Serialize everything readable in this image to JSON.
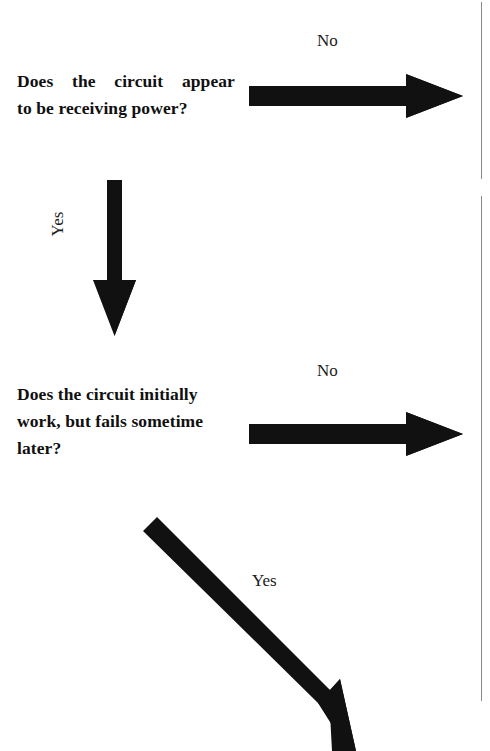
{
  "document": {
    "kind": "troubleshooting-flowchart-fragment",
    "background_color": "#ffffff",
    "ink_color": "#111111"
  },
  "nodes": [
    {
      "id": "question-1",
      "lines": [
        "Does the circuit appear",
        "to be receiving power?"
      ],
      "full_text": "Does the circuit appear to be receiving power?"
    },
    {
      "id": "question-2",
      "lines": [
        "Does the circuit initially",
        "work, but fails sometime",
        "later?"
      ],
      "full_text": "Does the circuit initially work, but fails sometime later?"
    }
  ],
  "edges": [
    {
      "id": "edge-q1-no",
      "label": "No",
      "direction": "right",
      "from": "question-1"
    },
    {
      "id": "edge-q1-yes",
      "label": "Yes",
      "direction": "down",
      "label_rotation_deg": -90,
      "from": "question-1",
      "to": "question-2"
    },
    {
      "id": "edge-q2-no",
      "label": "No",
      "direction": "right",
      "from": "question-2"
    },
    {
      "id": "edge-q2-yes",
      "label": "Yes",
      "direction": "down-right-diagonal",
      "from": "question-2"
    }
  ],
  "rules": [
    {
      "id": "vertical-rule-top",
      "orientation": "vertical",
      "color": "#8a8a8a"
    },
    {
      "id": "vertical-rule-bottom",
      "orientation": "vertical",
      "color": "#8a8a8a"
    }
  ]
}
